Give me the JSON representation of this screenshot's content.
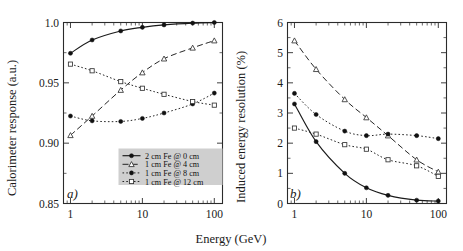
{
  "figure": {
    "xlabel": "Energy (GeV)",
    "panel_a_tag": "a)",
    "panel_b_tag": "b)"
  },
  "legend": {
    "items": [
      {
        "label": "2 cm Fe @ 0 cm",
        "marker": "filled-circle",
        "line": "solid"
      },
      {
        "label": "1 cm Fe @ 4 cm",
        "marker": "open-triangle",
        "line": "dashed"
      },
      {
        "label": "1 cm Fe @ 8 cm",
        "marker": "filled-circle",
        "line": "dotted"
      },
      {
        "label": "1 cm Fe @ 12 cm",
        "marker": "open-square",
        "line": "dotted"
      }
    ]
  },
  "chart_data": [
    {
      "type": "line",
      "panel": "a",
      "title": "",
      "xlabel": "Energy (GeV)",
      "ylabel": "Calorimeter response (a.u.)",
      "xscale": "log",
      "xlim": [
        0.8,
        130
      ],
      "ylim": [
        0.85,
        1.0
      ],
      "xticks": [
        1,
        10,
        100
      ],
      "xticklabels": [
        "1",
        "10",
        "100"
      ],
      "yticks": [
        0.85,
        0.9,
        0.95,
        1.0
      ],
      "yticklabels": [
        "0.85",
        "0.90",
        "0.95",
        "1.0"
      ],
      "grid": false,
      "legend_position": "lower-right",
      "x": [
        1,
        2,
        5,
        10,
        20,
        50,
        100
      ],
      "series": [
        {
          "name": "2 cm Fe @ 0 cm",
          "values": [
            0.9745,
            0.9855,
            0.993,
            0.996,
            0.998,
            0.9995,
            1.0
          ]
        },
        {
          "name": "1 cm Fe @ 4 cm",
          "values": [
            0.9065,
            0.9225,
            0.944,
            0.9585,
            0.97,
            0.979,
            0.985
          ]
        },
        {
          "name": "1 cm Fe @ 8 cm",
          "values": [
            0.9225,
            0.9185,
            0.918,
            0.9205,
            0.925,
            0.9325,
            0.9415
          ]
        },
        {
          "name": "1 cm Fe @ 12 cm",
          "values": [
            0.9655,
            0.96,
            0.951,
            0.9455,
            0.9405,
            0.9345,
            0.9315
          ]
        }
      ]
    },
    {
      "type": "line",
      "panel": "b",
      "title": "",
      "xlabel": "Energy (GeV)",
      "ylabel": "Induced energy resolution (%)",
      "xscale": "log",
      "xlim": [
        0.8,
        130
      ],
      "ylim": [
        0,
        6
      ],
      "xticks": [
        1,
        10,
        100
      ],
      "xticklabels": [
        "1",
        "10",
        "100"
      ],
      "yticks": [
        0,
        1,
        2,
        3,
        4,
        5,
        6
      ],
      "yticklabels": [
        "0",
        "1",
        "2",
        "3",
        "4",
        "5",
        "6"
      ],
      "grid": false,
      "legend_position": "none",
      "x": [
        1,
        2,
        5,
        10,
        20,
        50,
        100
      ],
      "series": [
        {
          "name": "2 cm Fe @ 0 cm",
          "values": [
            3.3,
            2.05,
            1.0,
            0.52,
            0.27,
            0.11,
            0.08
          ]
        },
        {
          "name": "1 cm Fe @ 4 cm",
          "values": [
            5.4,
            4.45,
            3.45,
            2.85,
            2.25,
            1.45,
            1.05
          ]
        },
        {
          "name": "1 cm Fe @ 8 cm",
          "values": [
            3.65,
            2.95,
            2.4,
            2.25,
            2.3,
            2.25,
            2.15
          ]
        },
        {
          "name": "1 cm Fe @ 12 cm",
          "values": [
            2.5,
            2.3,
            1.95,
            1.8,
            1.45,
            1.25,
            0.9
          ]
        }
      ]
    }
  ]
}
